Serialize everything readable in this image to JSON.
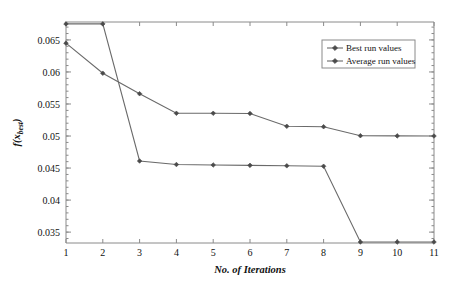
{
  "chart_data": {
    "type": "line",
    "title": "",
    "xlabel": "No. of Iterations",
    "ylabel": "f(x_best)",
    "ylabel_parts": {
      "func": "f",
      "open": "(",
      "var": "x",
      "sub": "best",
      "close": ")"
    },
    "x": [
      1,
      2,
      3,
      4,
      5,
      6,
      7,
      8,
      9,
      10,
      11
    ],
    "xticklabels": [
      "1",
      "2",
      "3",
      "4",
      "5",
      "6",
      "7",
      "8",
      "9",
      "10",
      "11"
    ],
    "xlim": [
      1,
      11
    ],
    "ylim": [
      0.0333,
      0.0678
    ],
    "yticks": [
      0.035,
      0.04,
      0.045,
      0.05,
      0.055,
      0.06,
      0.065
    ],
    "yticklabels": [
      "0.035",
      "0.04",
      "0.045",
      "0.05",
      "0.055",
      "0.06",
      "0.065"
    ],
    "grid": false,
    "legend_position": "top-right",
    "series": [
      {
        "name": "Best run values",
        "values": [
          0.0675,
          0.0675,
          0.0461,
          0.04555,
          0.04548,
          0.04542,
          0.04535,
          0.04528,
          0.03345,
          0.03345,
          0.03345
        ]
      },
      {
        "name": "Average run values",
        "values": [
          0.0645,
          0.0598,
          0.0566,
          0.05355,
          0.05355,
          0.05352,
          0.05152,
          0.05145,
          0.05005,
          0.05002,
          0.05
        ]
      }
    ]
  },
  "legend": {
    "entries": [
      {
        "label": "Best run values"
      },
      {
        "label": "Average run values"
      }
    ]
  }
}
